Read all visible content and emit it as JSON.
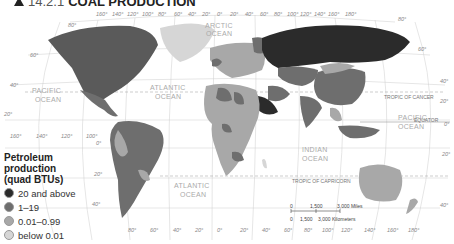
{
  "title": {
    "number": "14.2.1",
    "text": "COAL PRODUCTION"
  },
  "legend": {
    "title_lines": [
      "Petroleum",
      "production",
      "(quad BTUs)"
    ],
    "items": [
      {
        "label": "20 and above",
        "color": "#2b2b2b"
      },
      {
        "label": "1–19",
        "color": "#6e6e6e"
      },
      {
        "label": "0.01–0.99",
        "color": "#a8a8a8"
      },
      {
        "label": "below 0.01",
        "color": "#d6d6d6"
      }
    ]
  },
  "oceans": {
    "pacific_west": [
      "PACIFIC",
      "OCEAN"
    ],
    "atlantic_north": [
      "ATLANTIC",
      "OCEAN"
    ],
    "arctic": [
      "ARCTIC",
      "OCEAN"
    ],
    "pacific_east": [
      "PACIFIC",
      "OCEAN"
    ],
    "indian": [
      "INDIAN",
      "OCEAN"
    ],
    "atlantic_south": [
      "ATLANTIC",
      "OCEAN"
    ]
  },
  "lines": {
    "tropic_cancer": "TROPIC OF CANCER",
    "equator": "EQUATOR",
    "tropic_capricorn": "TROPIC OF CAPRICORN"
  },
  "top_longitudes": [
    "160°",
    "140°",
    "120°",
    "100°",
    "80°",
    "60°",
    "40°",
    "20°",
    "0°",
    "20°",
    "40°",
    "60°",
    "80°",
    "100°",
    "120°",
    "140°",
    "160°",
    "180°"
  ],
  "bottom_longitudes": [
    "160°",
    "140°",
    "120°",
    "100°",
    "80°",
    "60°",
    "40°",
    "20°",
    "0°",
    "20°",
    "40°",
    "60°",
    "80°",
    "100°",
    "120°",
    "140°",
    "160°",
    "180°"
  ],
  "latitudes_left": [
    "80°",
    "60°",
    "40°",
    "20°",
    "0°",
    "20°",
    "40°"
  ],
  "latitudes_right": [
    "80°",
    "60°",
    "40°",
    "20°",
    "0°",
    "20°",
    "40°"
  ],
  "scale": {
    "miles": [
      "0",
      "1,500",
      "3,000 Miles"
    ],
    "km": [
      "0",
      "1,500",
      "3,000 Kilometers"
    ]
  }
}
